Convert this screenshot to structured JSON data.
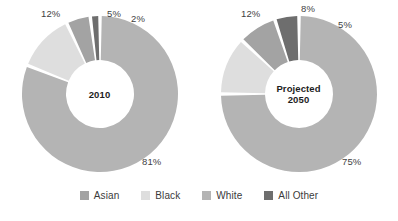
{
  "chart_data": [
    {
      "type": "pie",
      "title": "2010",
      "center_label": "2010",
      "donut": true,
      "categories": [
        "White",
        "Black",
        "Asian",
        "All Other"
      ],
      "values": [
        81,
        12,
        5,
        2
      ],
      "labels": [
        "81%",
        "12%",
        "5%",
        "2%"
      ],
      "colors": [
        "#b4b4b4",
        "#dedede",
        "#a3a3a3",
        "#6e6e6e"
      ],
      "legend_position": "bottom",
      "grid": false,
      "xlabel": "",
      "ylabel": ""
    },
    {
      "type": "pie",
      "title": "Projected 2050",
      "center_label": "Projected\n2050",
      "donut": true,
      "categories": [
        "White",
        "Black",
        "Asian",
        "All Other"
      ],
      "values": [
        75,
        12,
        8,
        5
      ],
      "labels": [
        "75%",
        "12%",
        "8%",
        "5%"
      ],
      "colors": [
        "#b4b4b4",
        "#dedede",
        "#a3a3a3",
        "#6e6e6e"
      ],
      "legend_position": "bottom",
      "grid": false,
      "xlabel": "",
      "ylabel": ""
    }
  ],
  "legend": {
    "items": [
      {
        "label": "Asian",
        "color": "#a3a3a3"
      },
      {
        "label": "Black",
        "color": "#dedede"
      },
      {
        "label": "White",
        "color": "#b4b4b4"
      },
      {
        "label": "All Other",
        "color": "#6e6e6e"
      }
    ]
  },
  "chart_left": {
    "center_line1": "2010",
    "pct_white": "81%",
    "pct_black": "12%",
    "pct_asian": "5%",
    "pct_all_other": "2%"
  },
  "chart_right": {
    "center_line1": "Projected",
    "center_line2": "2050",
    "pct_white": "75%",
    "pct_black": "12%",
    "pct_asian": "8%",
    "pct_all_other": "5%"
  }
}
